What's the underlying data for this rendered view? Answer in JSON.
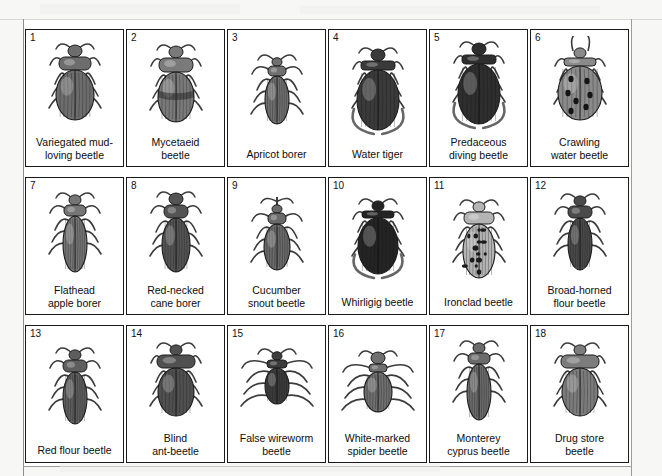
{
  "page": {
    "background_color": "#f7f7f5",
    "card_border_color": "#1a1a1a",
    "text_color": "#0d0d0d",
    "columns": 6,
    "rows": 3
  },
  "cards": [
    {
      "number": "1",
      "label": "Variegated mud-\nloving beetle",
      "icon": "beetle-icon",
      "shape": "broad-oval",
      "shade": "#6d6d6d"
    },
    {
      "number": "2",
      "label": "Mycetaeid\nbeetle",
      "icon": "beetle-icon",
      "shape": "banded-oval",
      "shade": "#7a7a7a"
    },
    {
      "number": "3",
      "label": "Apricot borer",
      "icon": "beetle-icon",
      "shape": "slender",
      "shade": "#707070"
    },
    {
      "number": "4",
      "label": "Water tiger",
      "icon": "beetle-icon",
      "shape": "diving",
      "shade": "#3a3a3a"
    },
    {
      "number": "5",
      "label": "Predaceous\ndiving beetle",
      "icon": "beetle-icon",
      "shape": "diving",
      "shade": "#2e2e2e"
    },
    {
      "number": "6",
      "label": "Crawling\nwater beetle",
      "icon": "beetle-icon",
      "shape": "spotted-round",
      "shade": "#8a8a8a"
    },
    {
      "number": "7",
      "label": "Flathead\napple borer",
      "icon": "beetle-icon",
      "shape": "elongate",
      "shade": "#767676"
    },
    {
      "number": "8",
      "label": "Red-necked\ncane borer",
      "icon": "beetle-icon",
      "shape": "click",
      "shade": "#545454"
    },
    {
      "number": "9",
      "label": "Cucumber\nsnout beetle",
      "icon": "beetle-icon",
      "shape": "snout",
      "shade": "#6a6a6a"
    },
    {
      "number": "10",
      "label": "Whirligig beetle",
      "icon": "beetle-icon",
      "shape": "whirligig",
      "shade": "#242424"
    },
    {
      "number": "11",
      "label": "Ironclad beetle",
      "icon": "beetle-icon",
      "shape": "mottled",
      "shade": "#b4b4b4"
    },
    {
      "number": "12",
      "label": "Broad-horned\nflour beetle",
      "icon": "beetle-icon",
      "shape": "flour",
      "shade": "#4a4a4a"
    },
    {
      "number": "13",
      "label": "Red flour beetle",
      "icon": "beetle-icon",
      "shape": "flour",
      "shade": "#5e5e5e"
    },
    {
      "number": "14",
      "label": "Blind\nant-beetle",
      "icon": "beetle-icon",
      "shape": "hooded",
      "shade": "#505050"
    },
    {
      "number": "15",
      "label": "False wireworm\nbeetle",
      "icon": "beetle-icon",
      "shape": "longlegs",
      "shade": "#3c3c3c"
    },
    {
      "number": "16",
      "label": "White-marked\nspider beetle",
      "icon": "beetle-icon",
      "shape": "spider",
      "shade": "#6f6f6f"
    },
    {
      "number": "17",
      "label": "Monterey\ncyprus beetle",
      "icon": "beetle-icon",
      "shape": "elongate",
      "shade": "#6b6b6b"
    },
    {
      "number": "18",
      "label": "Drug store\nbeetle",
      "icon": "beetle-icon",
      "shape": "hooded",
      "shade": "#7c7c7c"
    }
  ]
}
